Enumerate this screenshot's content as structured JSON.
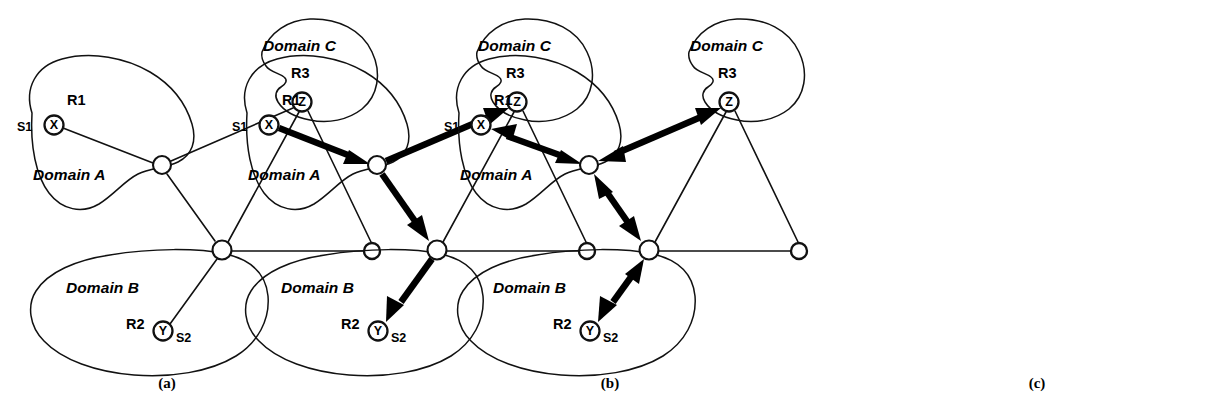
{
  "figure": {
    "panel_count": 3
  },
  "labels": {
    "domain_a": "Domain A",
    "domain_b": "Domain B",
    "domain_c": "Domain C",
    "r1": "R1",
    "r2": "R2",
    "r3": "R3",
    "s1": "S1",
    "s2": "S2",
    "node_x": "X",
    "node_y": "Y",
    "node_z": "Z"
  },
  "captions": {
    "a": "(a)",
    "b": "(b)",
    "c": "(c)"
  },
  "colors": {
    "ink": "#111111",
    "flow": "#000000",
    "background": "#ffffff"
  },
  "panels": [
    {
      "id": "a",
      "caption": "(a)",
      "flow_style": "none",
      "description": "Plain topology: three domain blobs with border nodes and thin links, no highlighted path."
    },
    {
      "id": "b",
      "caption": "(b)",
      "flow_style": "unidirectional",
      "description": "Heavy single-headed arrows trace the path X to hubA to Z, and hubA to hubB to Y."
    },
    {
      "id": "c",
      "caption": "(c)",
      "flow_style": "bidirectional",
      "description": "Heavy double-headed arrows on the same segments: X <-> hubA <-> Z and hubA <-> hubB <-> Y."
    }
  ],
  "nodes": [
    {
      "key": "x",
      "label": "X",
      "role": "host",
      "domain": "Domain A"
    },
    {
      "key": "y",
      "label": "Y",
      "role": "host",
      "domain": "Domain B"
    },
    {
      "key": "z",
      "label": "Z",
      "role": "host",
      "domain": "Domain C"
    },
    {
      "key": "hubA",
      "label": "",
      "role": "border-node",
      "domain": "Domain A"
    },
    {
      "key": "hubB",
      "label": "",
      "role": "border-node",
      "domain": "Domain B"
    },
    {
      "key": "east",
      "label": "",
      "role": "border-node",
      "domain": ""
    }
  ],
  "links": [
    {
      "from": "x",
      "to": "hubA",
      "highlighted_in": [
        "b",
        "c"
      ]
    },
    {
      "from": "hubA",
      "to": "z",
      "highlighted_in": [
        "b",
        "c"
      ]
    },
    {
      "from": "hubA",
      "to": "hubB",
      "highlighted_in": [
        "b",
        "c"
      ]
    },
    {
      "from": "hubB",
      "to": "y",
      "highlighted_in": [
        "b",
        "c"
      ]
    },
    {
      "from": "hubB",
      "to": "z",
      "highlighted_in": []
    },
    {
      "from": "hubB",
      "to": "east",
      "highlighted_in": []
    },
    {
      "from": "z",
      "to": "east",
      "highlighted_in": []
    }
  ]
}
